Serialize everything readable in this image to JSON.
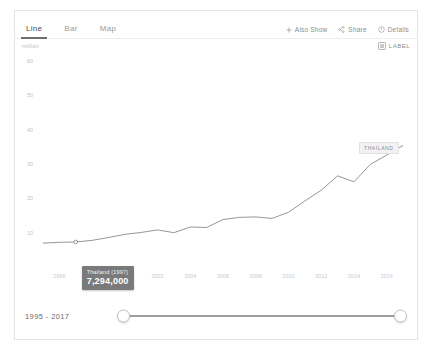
{
  "widget": {
    "tabs": [
      {
        "label": "Line",
        "active": true
      },
      {
        "label": "Bar",
        "active": false
      },
      {
        "label": "Map",
        "active": false
      }
    ],
    "actions": [
      {
        "label": "Also Show",
        "icon": "plus-icon"
      },
      {
        "label": "Share",
        "icon": "share-icon"
      },
      {
        "label": "Details",
        "icon": "info-icon"
      }
    ],
    "label_toggle": {
      "label": "LABEL",
      "checked": true,
      "icon": "checkbox-icon"
    }
  },
  "range_control": {
    "text": "1995 - 2017",
    "start": "1995",
    "end": "2017"
  },
  "tooltip": {
    "title": "Thailand (1997)",
    "value": "7,294,000"
  },
  "series_label": {
    "text": "THAILAND"
  },
  "colors": {
    "line": "#8a8a8a",
    "tooltip_bg": "#7a7a7a",
    "tab_active": "#6f6f6f",
    "axis_text": "#c2c2c2",
    "border": "#e4e4e4"
  },
  "chart_data": {
    "type": "line",
    "title": "",
    "xlabel": "",
    "ylabel": "million",
    "unit": "million",
    "grid": false,
    "legend_position": "inline-end-label",
    "xlim": [
      1995,
      2017
    ],
    "ylim": [
      0,
      60
    ],
    "yticks": [
      10,
      20,
      30,
      40,
      50,
      60
    ],
    "ytick_labels": [
      "10",
      "20",
      "30",
      "40",
      "50",
      "60"
    ],
    "xticks": [
      1996,
      1998,
      2000,
      2002,
      2004,
      2006,
      2008,
      2010,
      2012,
      2014,
      2016
    ],
    "xtick_labels": [
      "1996",
      "1998",
      "2000",
      "2002",
      "2004",
      "2006",
      "2008",
      "2010",
      "2012",
      "2014",
      "2016"
    ],
    "series": [
      {
        "name": "THAILAND",
        "x": [
          1995,
          1996,
          1997,
          1998,
          1999,
          2000,
          2001,
          2002,
          2003,
          2004,
          2005,
          2006,
          2007,
          2008,
          2009,
          2010,
          2011,
          2012,
          2013,
          2014,
          2015,
          2016,
          2017
        ],
        "values": [
          6.95,
          7.19,
          7.29,
          7.76,
          8.58,
          9.51,
          10.06,
          10.8,
          10.0,
          11.65,
          11.52,
          13.82,
          14.46,
          14.58,
          14.15,
          15.94,
          19.23,
          22.35,
          26.55,
          24.81,
          29.88,
          32.59,
          35.38
        ]
      }
    ],
    "highlight_point": {
      "x": 1997,
      "y": 7.29,
      "label": "7,294,000"
    }
  }
}
